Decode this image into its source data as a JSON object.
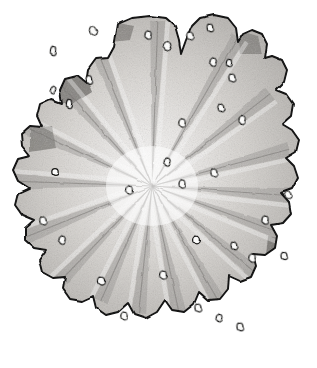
{
  "document": {
    "kind": "scientific-illustration",
    "medium": "graphite pencil drawing",
    "background_color": "#ffffff",
    "width": 317,
    "height": 368,
    "caption": "",
    "title": ""
  },
  "figure": {
    "subject_name": "radially-lobed-specimen",
    "symmetry": "radial",
    "lobe_count": 13,
    "pore_count": 34,
    "center": {
      "x": 152,
      "y": 186
    },
    "outline_stroke_color": "#121212",
    "outline_stroke_width": 1.9,
    "fill_light": "#e9e7e4",
    "fill_mid": "#c3c0bc",
    "fill_dark": "#8e8b88",
    "shadow_dark": "#5d5a57",
    "pore_fill": "#fbfbfa",
    "pore_stroke": "#151513"
  },
  "silhouette": {
    "name": "specimen-outline",
    "path": "M 118 24 L 132 18 L 150 16 L 166 18 L 175 26 L 179 40 L 181 54 L 186 40 L 192 26 L 200 18 L 214 15 L 228 18 L 236 28 L 238 42 L 243 34 L 252 30 L 262 34 L 267 44 L 265 58 L 272 56 L 282 60 L 287 70 L 284 82 L 276 90 L 286 94 L 293 104 L 291 116 L 282 124 L 292 130 L 299 140 L 296 152 L 286 158 L 294 166 L 298 178 L 292 189 L 281 193 L 289 202 L 291 214 L 283 223 L 271 225 L 277 236 L 275 248 L 265 255 L 253 254 L 256 266 L 251 277 L 240 281 L 229 276 L 228 289 L 220 299 L 208 300 L 199 292 L 194 304 L 184 312 L 172 310 L 165 300 L 157 312 L 146 318 L 134 314 L 128 303 L 118 312 L 106 315 L 96 308 L 93 296 L 82 301 L 70 299 L 63 289 L 65 277 L 53 278 L 42 272 L 39 260 L 46 250 L 34 248 L 25 240 L 25 228 L 34 220 L 22 215 L 15 205 L 18 193 L 29 188 L 18 181 L 13 170 L 18 159 L 30 156 L 22 146 L 21 134 L 30 126 L 42 127 L 37 116 L 40 104 L 51 99 L 62 103 L 60 90 L 65 79 L 77 76 L 86 83 L 88 70 L 96 59 L 108 58 L 114 47 Z"
  },
  "lobes": [
    {
      "id": 1,
      "name": "lobe-n",
      "angle_deg": 272,
      "tip": {
        "x": 155,
        "y": 20
      },
      "cleft_a": {
        "x": 180,
        "y": 44
      },
      "cleft_b": {
        "x": 120,
        "y": 42
      }
    },
    {
      "id": 2,
      "name": "lobe-nne",
      "angle_deg": 300,
      "tip": {
        "x": 214,
        "y": 20
      },
      "cleft_a": {
        "x": 240,
        "y": 44
      },
      "cleft_b": {
        "x": 186,
        "y": 40
      }
    },
    {
      "id": 3,
      "name": "lobe-ne",
      "angle_deg": 325,
      "tip": {
        "x": 262,
        "y": 40
      },
      "cleft_a": {
        "x": 276,
        "y": 66
      },
      "cleft_b": {
        "x": 243,
        "y": 34
      }
    },
    {
      "id": 4,
      "name": "lobe-ene",
      "angle_deg": 345,
      "tip": {
        "x": 287,
        "y": 76
      },
      "cleft_a": {
        "x": 285,
        "y": 98
      },
      "cleft_b": {
        "x": 272,
        "y": 56
      }
    },
    {
      "id": 5,
      "name": "lobe-e",
      "angle_deg": 3,
      "tip": {
        "x": 292,
        "y": 112
      },
      "cleft_a": {
        "x": 284,
        "y": 126
      },
      "cleft_b": {
        "x": 290,
        "y": 96
      }
    },
    {
      "id": 6,
      "name": "lobe-ese",
      "angle_deg": 18,
      "tip": {
        "x": 297,
        "y": 148
      },
      "cleft_a": {
        "x": 288,
        "y": 160
      },
      "cleft_b": {
        "x": 294,
        "y": 134
      }
    },
    {
      "id": 7,
      "name": "lobe-se",
      "angle_deg": 38,
      "tip": {
        "x": 296,
        "y": 182
      },
      "cleft_a": {
        "x": 283,
        "y": 194
      },
      "cleft_b": {
        "x": 294,
        "y": 170
      }
    },
    {
      "id": 8,
      "name": "lobe-sse",
      "angle_deg": 58,
      "tip": {
        "x": 289,
        "y": 215
      },
      "cleft_a": {
        "x": 272,
        "y": 226
      },
      "cleft_b": {
        "x": 288,
        "y": 204
      }
    },
    {
      "id": 9,
      "name": "lobe-s-e",
      "angle_deg": 76,
      "tip": {
        "x": 272,
        "y": 250
      },
      "cleft_a": {
        "x": 254,
        "y": 255
      },
      "cleft_b": {
        "x": 276,
        "y": 238
      }
    },
    {
      "id": 10,
      "name": "lobe-s",
      "angle_deg": 95,
      "tip": {
        "x": 247,
        "y": 278
      },
      "cleft_a": {
        "x": 229,
        "y": 278
      },
      "cleft_b": {
        "x": 256,
        "y": 266
      }
    },
    {
      "id": 11,
      "name": "lobe-ssw",
      "angle_deg": 112,
      "tip": {
        "x": 212,
        "y": 300
      },
      "cleft_a": {
        "x": 195,
        "y": 300
      },
      "cleft_b": {
        "x": 228,
        "y": 289
      }
    },
    {
      "id": 12,
      "name": "lobe-sw",
      "angle_deg": 133,
      "tip": {
        "x": 140,
        "y": 317
      },
      "cleft_a": {
        "x": 118,
        "y": 310
      },
      "cleft_b": {
        "x": 163,
        "y": 306
      }
    },
    {
      "id": 13,
      "name": "lobe-w",
      "angle_deg": 200,
      "tip": {
        "x": 14,
        "y": 176
      },
      "cleft_a": {
        "x": 22,
        "y": 148
      },
      "cleft_b": {
        "x": 20,
        "y": 200
      }
    }
  ],
  "radial_folds": [
    {
      "name": "fold-ridge-1",
      "angle_deg": 272,
      "length": 165
    },
    {
      "name": "fold-ridge-2",
      "angle_deg": 300,
      "length": 172
    },
    {
      "name": "fold-ridge-3",
      "angle_deg": 322,
      "length": 150
    },
    {
      "name": "fold-ridge-4",
      "angle_deg": 345,
      "length": 142
    },
    {
      "name": "fold-ridge-5",
      "angle_deg": 4,
      "length": 140
    },
    {
      "name": "fold-ridge-6",
      "angle_deg": 20,
      "length": 146
    },
    {
      "name": "fold-ridge-7",
      "angle_deg": 40,
      "length": 142
    },
    {
      "name": "fold-ridge-8",
      "angle_deg": 60,
      "length": 140
    },
    {
      "name": "fold-ridge-9",
      "angle_deg": 78,
      "length": 132
    },
    {
      "name": "fold-ridge-10",
      "angle_deg": 96,
      "length": 128
    },
    {
      "name": "fold-ridge-11",
      "angle_deg": 114,
      "length": 126
    },
    {
      "name": "fold-ridge-12",
      "angle_deg": 134,
      "length": 140
    },
    {
      "name": "fold-ridge-13",
      "angle_deg": 158,
      "length": 138
    },
    {
      "name": "fold-ridge-14",
      "angle_deg": 182,
      "length": 140
    },
    {
      "name": "fold-ridge-15",
      "angle_deg": 205,
      "length": 144
    },
    {
      "name": "fold-ridge-16",
      "angle_deg": 228,
      "length": 140
    },
    {
      "name": "fold-ridge-17",
      "angle_deg": 248,
      "length": 150
    }
  ],
  "pores": [
    {
      "x": 93,
      "y": 31,
      "rx": 3.4,
      "ry": 4.6,
      "rot": -20
    },
    {
      "x": 53,
      "y": 51,
      "rx": 2.6,
      "ry": 4.6,
      "rot": 8
    },
    {
      "x": 89,
      "y": 80,
      "rx": 2.7,
      "ry": 4.4,
      "rot": -6
    },
    {
      "x": 69,
      "y": 104,
      "rx": 2.6,
      "ry": 4.6,
      "rot": 4
    },
    {
      "x": 53,
      "y": 90,
      "rx": 2.4,
      "ry": 3.6,
      "rot": 24
    },
    {
      "x": 167,
      "y": 46,
      "rx": 3.6,
      "ry": 4.4,
      "rot": 22
    },
    {
      "x": 190,
      "y": 36,
      "rx": 3.2,
      "ry": 4.0,
      "rot": -14
    },
    {
      "x": 148,
      "y": 35,
      "rx": 3.0,
      "ry": 4.0,
      "rot": 10
    },
    {
      "x": 210,
      "y": 28,
      "rx": 2.8,
      "ry": 3.8,
      "rot": -8
    },
    {
      "x": 213,
      "y": 62,
      "rx": 3.0,
      "ry": 4.0,
      "rot": 16
    },
    {
      "x": 232,
      "y": 78,
      "rx": 3.0,
      "ry": 4.0,
      "rot": -10
    },
    {
      "x": 229,
      "y": 63,
      "rx": 2.6,
      "ry": 3.6,
      "rot": 6
    },
    {
      "x": 242,
      "y": 120,
      "rx": 3.0,
      "ry": 4.4,
      "rot": 12
    },
    {
      "x": 221,
      "y": 108,
      "rx": 2.8,
      "ry": 4.0,
      "rot": -16
    },
    {
      "x": 182,
      "y": 123,
      "rx": 3.2,
      "ry": 4.2,
      "rot": 8
    },
    {
      "x": 55,
      "y": 172,
      "rx": 3.2,
      "ry": 3.4,
      "rot": 0
    },
    {
      "x": 129,
      "y": 190,
      "rx": 3.4,
      "ry": 3.8,
      "rot": 14
    },
    {
      "x": 214,
      "y": 173,
      "rx": 3.0,
      "ry": 4.2,
      "rot": -12
    },
    {
      "x": 182,
      "y": 184,
      "rx": 3.0,
      "ry": 4.2,
      "rot": 6
    },
    {
      "x": 167,
      "y": 162,
      "rx": 2.8,
      "ry": 3.8,
      "rot": 18
    },
    {
      "x": 288,
      "y": 195,
      "rx": 3.0,
      "ry": 4.2,
      "rot": -22
    },
    {
      "x": 265,
      "y": 220,
      "rx": 3.0,
      "ry": 4.0,
      "rot": 10
    },
    {
      "x": 284,
      "y": 256,
      "rx": 3.0,
      "ry": 3.6,
      "rot": -6
    },
    {
      "x": 252,
      "y": 258,
      "rx": 3.2,
      "ry": 4.0,
      "rot": 12
    },
    {
      "x": 196,
      "y": 240,
      "rx": 3.4,
      "ry": 3.8,
      "rot": 0
    },
    {
      "x": 234,
      "y": 246,
      "rx": 2.8,
      "ry": 3.8,
      "rot": -14
    },
    {
      "x": 163,
      "y": 275,
      "rx": 3.4,
      "ry": 4.0,
      "rot": 8
    },
    {
      "x": 198,
      "y": 308,
      "rx": 3.0,
      "ry": 4.0,
      "rot": -10
    },
    {
      "x": 219,
      "y": 318,
      "rx": 2.8,
      "ry": 3.6,
      "rot": 14
    },
    {
      "x": 240,
      "y": 327,
      "rx": 3.0,
      "ry": 3.8,
      "rot": -8
    },
    {
      "x": 124,
      "y": 316,
      "rx": 3.2,
      "ry": 3.8,
      "rot": 6
    },
    {
      "x": 101,
      "y": 281,
      "rx": 3.6,
      "ry": 4.0,
      "rot": -4
    },
    {
      "x": 62,
      "y": 240,
      "rx": 3.0,
      "ry": 4.0,
      "rot": 16
    },
    {
      "x": 43,
      "y": 221,
      "rx": 3.2,
      "ry": 4.2,
      "rot": -12
    }
  ],
  "shadow_patches": [
    {
      "name": "shadow-upper-left-cleft",
      "path": "M 60 64 L 84 72 L 92 92 L 70 106 L 52 96 L 50 76 Z",
      "opacity": 0.72
    },
    {
      "name": "shadow-top-cleft",
      "path": "M 113 22 L 134 26 L 130 40 L 112 42 Z",
      "opacity": 0.55
    },
    {
      "name": "shadow-ne-cleft",
      "path": "M 236 30 L 258 36 L 262 54 L 240 54 Z",
      "opacity": 0.52
    },
    {
      "name": "shadow-left-notch",
      "path": "M 30 128 L 52 126 L 56 148 L 30 152 Z",
      "opacity": 0.6
    },
    {
      "name": "shadow-right-edge",
      "path": "M 268 236 L 288 240 L 286 258 L 266 256 Z",
      "opacity": 0.7
    },
    {
      "name": "shadow-lower-right",
      "path": "M 248 282 L 268 290 L 262 308 L 242 300 Z",
      "opacity": 0.58
    }
  ],
  "texture": {
    "name": "graphite-stipple",
    "grain_density": "high",
    "base_opacity": 0.5
  }
}
